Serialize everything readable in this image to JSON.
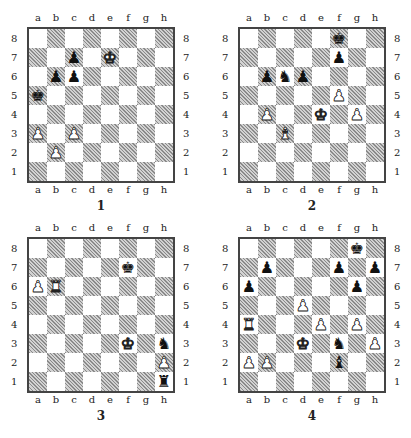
{
  "files": [
    "a",
    "b",
    "c",
    "d",
    "e",
    "f",
    "g",
    "h"
  ],
  "ranks": [
    "8",
    "7",
    "6",
    "5",
    "4",
    "3",
    "2",
    "1"
  ],
  "piece_glyphs": {
    "K": "♔",
    "Q": "♕",
    "R": "♖",
    "B": "♗",
    "N": "♘",
    "P": "♙",
    "k": "♚",
    "q": "♛",
    "r": "♜",
    "b": "♝",
    "n": "♞",
    "p": "♟"
  },
  "colors": {
    "light_square": "#ffffff",
    "dark_square_hatch": "#8a8a8a",
    "border": "#444444"
  },
  "diagrams": [
    {
      "caption": "1",
      "pieces": [
        {
          "square": "e7",
          "piece": "K"
        },
        {
          "square": "a3",
          "piece": "P"
        },
        {
          "square": "c3",
          "piece": "P"
        },
        {
          "square": "b2",
          "piece": "P"
        },
        {
          "square": "a5",
          "piece": "k"
        },
        {
          "square": "c7",
          "piece": "p"
        },
        {
          "square": "b6",
          "piece": "p"
        },
        {
          "square": "c6",
          "piece": "p"
        }
      ]
    },
    {
      "caption": "2",
      "pieces": [
        {
          "square": "f8",
          "piece": "k"
        },
        {
          "square": "f7",
          "piece": "p"
        },
        {
          "square": "b6",
          "piece": "p"
        },
        {
          "square": "c6",
          "piece": "n"
        },
        {
          "square": "d6",
          "piece": "p"
        },
        {
          "square": "f5",
          "piece": "P"
        },
        {
          "square": "b4",
          "piece": "P"
        },
        {
          "square": "e4",
          "piece": "K"
        },
        {
          "square": "g4",
          "piece": "P"
        },
        {
          "square": "c3",
          "piece": "B"
        }
      ]
    },
    {
      "caption": "3",
      "pieces": [
        {
          "square": "f7",
          "piece": "k"
        },
        {
          "square": "a6",
          "piece": "P"
        },
        {
          "square": "b6",
          "piece": "R"
        },
        {
          "square": "f3",
          "piece": "K"
        },
        {
          "square": "h3",
          "piece": "n"
        },
        {
          "square": "h2",
          "piece": "P"
        },
        {
          "square": "h1",
          "piece": "r"
        }
      ]
    },
    {
      "caption": "4",
      "pieces": [
        {
          "square": "g8",
          "piece": "k"
        },
        {
          "square": "b7",
          "piece": "p"
        },
        {
          "square": "f7",
          "piece": "p"
        },
        {
          "square": "h7",
          "piece": "p"
        },
        {
          "square": "a6",
          "piece": "p"
        },
        {
          "square": "g6",
          "piece": "p"
        },
        {
          "square": "d5",
          "piece": "P"
        },
        {
          "square": "a4",
          "piece": "R"
        },
        {
          "square": "e4",
          "piece": "P"
        },
        {
          "square": "g4",
          "piece": "P"
        },
        {
          "square": "d3",
          "piece": "K"
        },
        {
          "square": "f3",
          "piece": "n"
        },
        {
          "square": "h3",
          "piece": "P"
        },
        {
          "square": "a2",
          "piece": "P"
        },
        {
          "square": "b2",
          "piece": "P"
        },
        {
          "square": "f2",
          "piece": "b"
        }
      ]
    }
  ]
}
